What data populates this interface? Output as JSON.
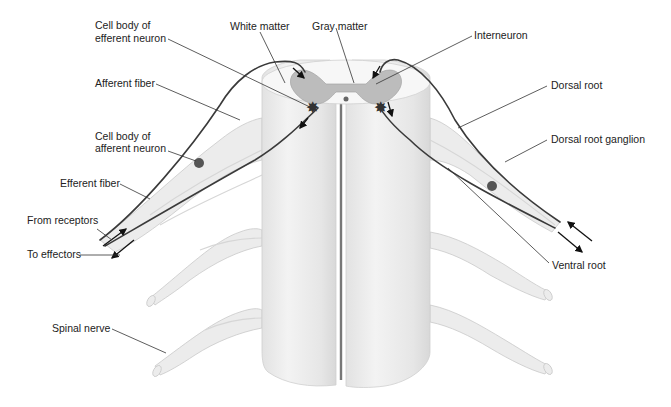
{
  "figure": {
    "labels": {
      "cell_body_efferent_1": "Cell body of",
      "cell_body_efferent_2": "efferent neuron",
      "white_matter": "White matter",
      "gray_matter": "Gray matter",
      "interneuron": "Interneuron",
      "afferent_fiber": "Afferent fiber",
      "dorsal_root": "Dorsal root",
      "cell_body_afferent_1": "Cell body of",
      "cell_body_afferent_2": "afferent neuron",
      "dorsal_root_ganglion": "Dorsal root ganglion",
      "efferent_fiber": "Efferent fiber",
      "from_receptors": "From receptors",
      "to_effectors": "To effectors",
      "ventral_root": "Ventral root",
      "spinal_nerve": "Spinal nerve"
    },
    "colors": {
      "background": "#ffffff",
      "cord": "#e8e8e8",
      "gray_matter": "#b8b8b8",
      "fiber": "#3a3a3a",
      "label_text": "#222222"
    }
  }
}
